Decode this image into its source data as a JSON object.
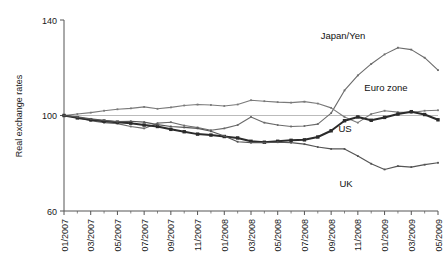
{
  "chart_data": {
    "type": "line",
    "title": "",
    "xlabel": "",
    "ylabel": "Real exchange rates",
    "ylim": [
      60,
      140
    ],
    "yticks": [
      60,
      100,
      140
    ],
    "grid": false,
    "reference_line": 100,
    "legend_position": "inline-annotations",
    "x": [
      "01/2007",
      "02/2007",
      "03/2007",
      "04/2007",
      "05/2007",
      "06/2007",
      "07/2007",
      "08/2007",
      "09/2007",
      "10/2007",
      "11/2007",
      "12/2007",
      "01/2008",
      "02/2008",
      "03/2008",
      "04/2008",
      "05/2008",
      "06/2008",
      "07/2008",
      "08/2008",
      "09/2008",
      "10/2008",
      "11/2008",
      "12/2008",
      "01/2009",
      "02/2009",
      "03/2009",
      "04/2009",
      "05/2009"
    ],
    "xtick_labels": [
      "01/2007",
      "03/2007",
      "05/2007",
      "07/2007",
      "09/2007",
      "11/2007",
      "01/2008",
      "03/2008",
      "05/2008",
      "07/2008",
      "09/2008",
      "11/2008",
      "01/2009",
      "03/2009",
      "05/2009"
    ],
    "series": [
      {
        "name": "Japan/Yen",
        "color": "#6b6b6b",
        "marker": "small-dot",
        "width": 1.1,
        "values": [
          100,
          99.2,
          97.8,
          97.0,
          96.6,
          95.4,
          94.6,
          96.8,
          97.2,
          95.8,
          95.0,
          93.8,
          94.6,
          96.0,
          99.4,
          97.0,
          96.0,
          95.4,
          95.6,
          96.4,
          101.0,
          110.5,
          116.8,
          121.6,
          125.6,
          128.4,
          127.6,
          124.2,
          119.0
        ]
      },
      {
        "name": "Euro zone",
        "color": "#7a7a7a",
        "marker": "small-dot",
        "width": 1.1,
        "values": [
          100,
          100.6,
          101.2,
          102.0,
          102.6,
          103.0,
          103.6,
          102.8,
          103.4,
          104.2,
          104.6,
          104.4,
          104.0,
          104.6,
          106.4,
          106.0,
          105.6,
          105.4,
          105.8,
          105.0,
          103.2,
          99.4,
          97.0,
          100.6,
          102.0,
          101.4,
          101.2,
          102.0,
          102.2
        ]
      },
      {
        "name": "US",
        "color": "#2b2b2b",
        "marker": "square",
        "width": 2.0,
        "values": [
          100,
          99.0,
          98.2,
          97.6,
          97.2,
          96.8,
          96.0,
          95.4,
          94.2,
          93.2,
          92.2,
          91.8,
          91.2,
          90.6,
          89.2,
          88.8,
          89.2,
          89.6,
          89.8,
          91.0,
          93.6,
          97.8,
          99.4,
          98.0,
          99.2,
          100.6,
          101.6,
          100.4,
          98.2
        ]
      },
      {
        "name": "UK",
        "color": "#555555",
        "marker": "small-dot",
        "width": 1.2,
        "values": [
          100,
          99.4,
          98.6,
          98.0,
          97.4,
          97.6,
          97.2,
          96.2,
          95.4,
          95.0,
          94.6,
          93.4,
          91.4,
          89.0,
          88.6,
          88.6,
          88.8,
          88.6,
          88.0,
          86.8,
          86.0,
          86.0,
          83.0,
          79.8,
          77.4,
          78.8,
          78.4,
          79.4,
          80.2
        ]
      }
    ],
    "annotations": [
      {
        "text": "Japan/Yen",
        "x": 343,
        "y": 39
      },
      {
        "text": "Euro zone",
        "x": 386,
        "y": 91
      },
      {
        "text": "US",
        "x": 345,
        "y": 132
      },
      {
        "text": "UK",
        "x": 346,
        "y": 187
      }
    ]
  },
  "axis": {
    "y_title": "Real exchange rates",
    "y_tick_top": "140",
    "y_tick_mid": "100",
    "y_tick_bottom": "60"
  }
}
